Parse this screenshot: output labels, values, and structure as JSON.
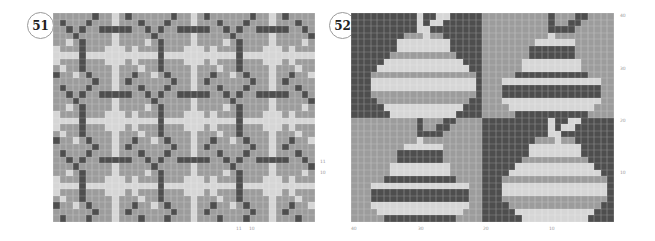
{
  "charts": [
    {
      "number": "51",
      "cols": 40,
      "rows": 32,
      "tile": [
        "MMMMMMDMMLMDM",
        "MDMMMDMMMLMMD",
        "MMDMDMMDDDDDD",
        "MMMDMMMMMLMMM",
        "MMLMDMMMMLMMM",
        "LMMMDMMMLLLMM",
        "LLLLDLLLLLLLL",
        "LMMMDMMMLLLMM",
        "MLMMDMMMMLMMM",
        "DMMLMDMMMLMMD"
      ],
      "tile_width": 12,
      "tile_height": 10,
      "labels": {
        "side": [
          "11",
          "10"
        ],
        "bottom": [
          "11",
          "10"
        ]
      }
    },
    {
      "number": "52",
      "quad_cols": 20,
      "quad_rows": 16,
      "quadrants": [
        {
          "name": "top-left-pear",
          "rows": [
            "DDDDDDDDDDLDDLLDDDDD",
            "DDDDDDDDDDLDLLDDDDDD",
            "DDDDDDDDDDLLDDDDDDDD",
            "DDDDDDDDMMMLMMDDDDDD",
            "DDDDDDDLLLLLLLLDDDDD",
            "DDDDDDDLLLLLLLLDDDDD",
            "DDDDDDMMMMMMMMMMDDDD",
            "DDDDDLLLLLLLLLLLLDDD",
            "DDDDLLLLLLLLLLLLLLDD",
            "DDDMMMMMMMMMMMMMMMMD",
            "DDDLLLLLLLLLLLLLLLLD",
            "DDDLLLLLLLLLLLLLLLLD",
            "DDDMMMMMMMMMMMMMMMMD",
            "DDDDMMMMMMMMMMMMMMDD",
            "DDDDDLLLLLLLLLLLLDDD",
            "DDDDDDLLLLLLLLLLDDDD"
          ]
        },
        {
          "name": "top-right-pear",
          "rows": [
            "MMMMMMMMMMDMMMDDMMMM",
            "MMMMMMMMMMDMMDDMMMMM",
            "MMMMMMMMMMDDDDMMMMMM",
            "MMMMMMMMMMLMMMMMMMMM",
            "MMMMMMMMLLLLLLMMMMMM",
            "MMMMMMMDDDDDDDMMMMMM",
            "MMMMMMMDDDDDDDMMMMMM",
            "MMMMMMLLLLLLLLLMMMMM",
            "MMMMMMLLLLLLLLLMMMMM",
            "MMMMMDDDDDDDDDDDMMMM",
            "MMMLLLLLLLLLLLLLLLMM",
            "MMMDDDDDDDDDDDDDDDMM",
            "MMMDDDDDDDDDDDDDDDMM",
            "MMMLLLLLLLLLLLLLLLMM",
            "MMMMLLLLLLLLLLLLLMMM",
            "MMMMMDDDDDDDDDDDMMMM"
          ]
        },
        {
          "name": "bottom-left-pear",
          "rows": [
            "MMMMMMMMMMDMMMDDMMMM",
            "MMMMMMMMMMDMMDDMMMMM",
            "MMMMMMMMMMDDDDMMMMMM",
            "MMMMMMMMMMLMMMMMMMMM",
            "MMMMMMMMLLLLLLMMMMMM",
            "MMMMMMMDDDDDDDMMMMMM",
            "MMMMMMMDDDDDDDMMMMMM",
            "MMMMMMLLLLLLLLLMMMMM",
            "MMMMMMLLLLLLLLLMMMMM",
            "MMMMMDDDDDDDDDDDMMMM",
            "MMMLLLLLLLLLLLLLLLMM",
            "MMMDDDDDDDDDDDDDDDMM",
            "MMMDDDDDDDDDDDDDDDMM",
            "MMMLLLLLLLLLLLLLLLMM",
            "MMMMLLLLLLLLLLLLLMMM",
            "MMMMMDDDDDDDDDDDMMMM"
          ]
        },
        {
          "name": "bottom-right-pear",
          "rows": [
            "DDDDDDDDDDLDDLLDDDDD",
            "DDDDDDDDDDLDLLDDDDDD",
            "DDDDDDDDDDLLDDDDDDDD",
            "DDDDDDDDMMMLMMDDDDDD",
            "DDDDDDDLLLLLLLLDDDDD",
            "DDDDDDDLLLLLLLLDDDDD",
            "DDDDDDMMMMMMMMMMDDDD",
            "DDDDDLLLLLLLLLLLLDDD",
            "DDDDLLLLLLLLLLLLLLDD",
            "DDDMMMMMMMMMMMMMMMMD",
            "DDDLLLLLLLLLLLLLLLLD",
            "DDDLLLLLLLLLLLLLLLLD",
            "DDDMMMMMMMMMMMMMMMMD",
            "DDDDMMMMMMMMMMMMMMDD",
            "DDDDDLLLLLLLLLLLLDDD",
            "DDDDDDLLLLLLLLLLDDDD"
          ]
        }
      ],
      "labels": {
        "side": [
          "40",
          "30",
          "20",
          "10"
        ],
        "bottom": [
          "40",
          "30",
          "20",
          "10"
        ]
      }
    }
  ],
  "colors": {
    "dark": "#4e4e4e",
    "mid": "#9c9c9c",
    "light": "#d6d6d6"
  }
}
